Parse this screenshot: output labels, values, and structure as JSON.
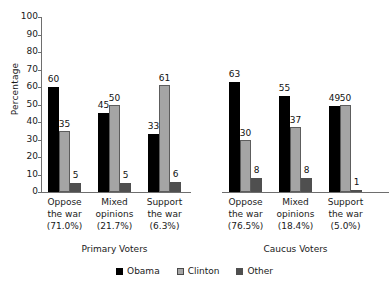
{
  "chart_data": {
    "type": "bar",
    "title": "",
    "xlabel": "",
    "ylabel": "Percentage",
    "ylim": [
      0,
      100
    ],
    "yticks": [
      0,
      10,
      20,
      30,
      40,
      50,
      60,
      70,
      80,
      90,
      100
    ],
    "grid": false,
    "legend_position": "bottom",
    "legend": [
      "Obama",
      "Clinton",
      "Other"
    ],
    "series": [
      {
        "name": "Obama",
        "color": "#000000",
        "values": [
          60,
          45,
          33,
          63,
          55,
          49
        ]
      },
      {
        "name": "Clinton",
        "color": "#a5a5a5",
        "values": [
          35,
          50,
          61,
          30,
          37,
          50
        ]
      },
      {
        "name": "Other",
        "color": "#4f4f4f",
        "values": [
          5,
          5,
          6,
          8,
          8,
          1
        ]
      }
    ],
    "panels": [
      {
        "title": "Primary Voters",
        "groups": [
          {
            "name": "Oppose the war",
            "line1": "Oppose",
            "line2": "the war",
            "pct": "(71.0%)",
            "values": {
              "Obama": 60,
              "Clinton": 35,
              "Other": 5
            }
          },
          {
            "name": "Mixed opinions",
            "line1": "Mixed",
            "line2": "opinions",
            "pct": "(21.7%)",
            "values": {
              "Obama": 45,
              "Clinton": 50,
              "Other": 5
            }
          },
          {
            "name": "Support the war",
            "line1": "Support",
            "line2": "the war",
            "pct": "(6.3%)",
            "values": {
              "Obama": 33,
              "Clinton": 61,
              "Other": 6
            }
          }
        ]
      },
      {
        "title": "Caucus Voters",
        "groups": [
          {
            "name": "Oppose the war",
            "line1": "Oppose",
            "line2": "the war",
            "pct": "(76.5%)",
            "values": {
              "Obama": 63,
              "Clinton": 30,
              "Other": 8
            }
          },
          {
            "name": "Mixed opinions",
            "line1": "Mixed",
            "line2": "opinions",
            "pct": "(18.4%)",
            "values": {
              "Obama": 55,
              "Clinton": 37,
              "Other": 8
            }
          },
          {
            "name": "Support the war",
            "line1": "Support",
            "line2": "the war",
            "pct": "(5.0%)",
            "values": {
              "Obama": 49,
              "Clinton": 50,
              "Other": 1
            }
          }
        ]
      }
    ]
  },
  "axis": {
    "y_title": "Percentage",
    "ticks": [
      "100",
      "90",
      "80",
      "70",
      "60",
      "50",
      "40",
      "30",
      "20",
      "10",
      "0"
    ]
  },
  "legend": {
    "items": [
      {
        "label": "Obama",
        "swatch": "obama"
      },
      {
        "label": "Clinton",
        "swatch": "clinton"
      },
      {
        "label": "Other",
        "swatch": "other"
      }
    ]
  },
  "panel_titles": {
    "primary": "Primary Voters",
    "caucus": "Caucus Voters"
  }
}
